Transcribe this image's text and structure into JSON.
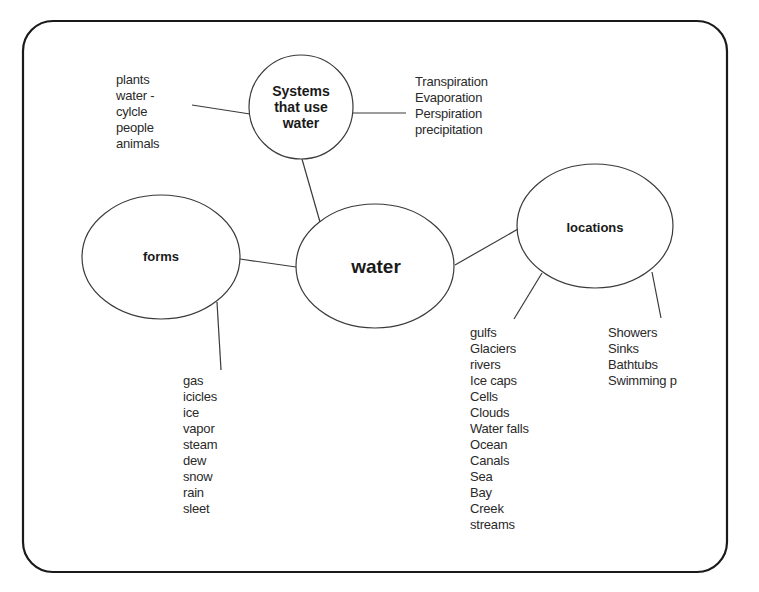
{
  "diagram": {
    "type": "concept-map",
    "center_node": {
      "id": "water",
      "label": "water"
    },
    "nodes": {
      "systems": {
        "label_lines": [
          "Systems",
          "that use",
          "water"
        ]
      },
      "forms": {
        "label": "forms"
      },
      "water": {
        "label": "water"
      },
      "locations": {
        "label": "locations"
      }
    },
    "lists": {
      "systems_left": {
        "items": [
          "plants",
          "water -",
          "cylcle",
          "people",
          "animals"
        ]
      },
      "systems_right": {
        "items": [
          "Transpiration",
          "Evaporation",
          "Perspiration",
          "precipitation"
        ]
      },
      "forms": {
        "items": [
          "gas",
          "icicles",
          "ice",
          "vapor",
          "steam",
          "dew",
          "snow",
          "rain",
          "sleet"
        ]
      },
      "locations_natural": {
        "items": [
          "gulfs",
          "Glaciers",
          "rivers",
          "Ice caps",
          "Cells",
          "Clouds",
          "Water falls",
          "Ocean",
          "Canals",
          "Sea",
          "Bay",
          "Creek",
          "streams"
        ]
      },
      "locations_household": {
        "items": [
          "Showers",
          "Sinks",
          "Bathtubs",
          "Swimming p"
        ]
      }
    },
    "edges": [
      [
        "water",
        "systems"
      ],
      [
        "water",
        "forms"
      ],
      [
        "water",
        "locations"
      ],
      [
        "systems",
        "systems_left"
      ],
      [
        "systems",
        "systems_right"
      ],
      [
        "forms",
        "forms_list"
      ],
      [
        "locations",
        "locations_natural"
      ],
      [
        "locations",
        "locations_household"
      ]
    ],
    "colors": {
      "stroke": "#3a3a3a",
      "frame": "#1a1a1a",
      "background": "#ffffff",
      "text": "#2a2a2a"
    }
  }
}
